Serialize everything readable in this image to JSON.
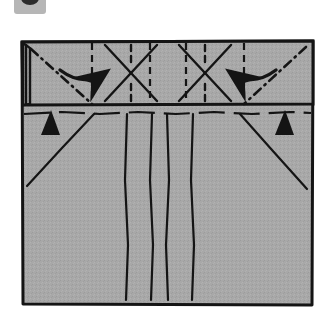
{
  "page": {
    "background_color": "#ffffff",
    "width": 334,
    "height": 324
  },
  "step_badge": {
    "name": "step-number-badge",
    "badge_color": "#b6b6b6",
    "disc_color": "#2b2b2b",
    "note": "partially cropped step marker at top-left"
  },
  "figure": {
    "paper_fill": "#a8a8a8",
    "line_color": "#141414",
    "outline": {
      "left": 22,
      "top": 41,
      "right": 313,
      "bottom": 305
    },
    "band": {
      "label": "top folded band",
      "top": 41,
      "bottom": 104,
      "left": 22,
      "right": 313
    },
    "left_flap": {
      "label": "left edge flap",
      "left": 22,
      "right": 30,
      "top": 41,
      "bottom": 104
    },
    "horizontal_crease": {
      "label": "horizontal valley crease below band",
      "y": 113,
      "style": "dashed"
    },
    "band_vertical_creases": {
      "label": "vertical creases inside band",
      "style": "dashed",
      "x_positions": [
        92,
        150,
        186,
        244
      ]
    },
    "body_vertical_creases": {
      "label": "vertical creases on main body",
      "style": "solid-wavy",
      "x_positions": [
        127,
        152,
        167,
        193
      ]
    },
    "asterisk_creases": [
      {
        "label": "left asterisk crease cluster",
        "cx": 131,
        "cy": 73
      },
      {
        "label": "right asterisk crease cluster",
        "cx": 205,
        "cy": 73
      }
    ],
    "dash_dot_creases": [
      {
        "label": "left diagonal dash-dot crease",
        "from": [
          30,
          49
        ],
        "to": [
          92,
          104
        ]
      },
      {
        "label": "right diagonal dash-dot crease",
        "from": [
          308,
          49
        ],
        "to": [
          244,
          104
        ]
      }
    ],
    "diagonal_creases": [
      {
        "label": "left body diagonal crease",
        "from": [
          27,
          186
        ],
        "to": [
          94,
          113
        ]
      },
      {
        "label": "right body diagonal crease",
        "from": [
          307,
          188
        ],
        "to": [
          240,
          113
        ]
      }
    ],
    "arrows": [
      {
        "label": "left fold arrow",
        "direction": "right",
        "from": [
          65,
          73
        ],
        "to": [
          111,
          71
        ]
      },
      {
        "label": "right fold arrow",
        "direction": "left",
        "from": [
          271,
          73
        ],
        "to": [
          226,
          71
        ]
      }
    ],
    "push_arrows": [
      {
        "label": "left push arrowhead",
        "x": 51,
        "y": 118,
        "points": "up"
      },
      {
        "label": "right push arrowhead",
        "x": 284,
        "y": 118,
        "points": "up"
      }
    ]
  }
}
